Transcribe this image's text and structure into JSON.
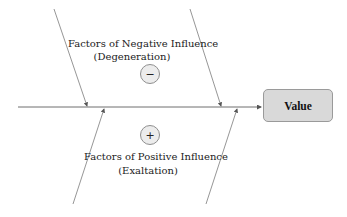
{
  "diagram": {
    "type": "fishbone",
    "negative": {
      "title": "Factors of Negative Influence",
      "subtitle": "(Degeneration)",
      "sign": "−"
    },
    "positive": {
      "title": "Factors of Positive Influence",
      "subtitle": "(Exaltation)",
      "sign": "+"
    },
    "head": {
      "label": "Value"
    },
    "colors": {
      "line": "#6e6e6e",
      "box_fill": "#d9d9d9",
      "circle_fill": "#ececec"
    }
  }
}
